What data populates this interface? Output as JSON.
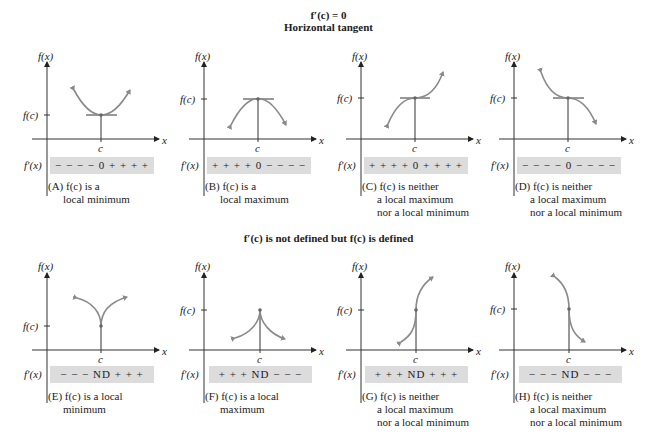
{
  "sections": [
    {
      "title_line1": "f′(c) = 0",
      "title_line2": "Horizontal tangent"
    },
    {
      "title_line1": "f′(c) is not defined but f(c) is defined"
    }
  ],
  "axis_labels": {
    "y": "f(x)",
    "x": "x",
    "fc": "f(c)",
    "c": "c",
    "fprime": "f′(x)"
  },
  "panels": [
    {
      "id": "A",
      "signs": "− − − − 0 + + + +",
      "caption_prefix": "(A)",
      "caption_lines": [
        "f(c) is a",
        "local minimum"
      ]
    },
    {
      "id": "B",
      "signs": "+ + + + 0 − − − −",
      "caption_prefix": "(B)",
      "caption_lines": [
        "f(c) is a",
        "local maximum"
      ]
    },
    {
      "id": "C",
      "signs": "+ + + + 0 + + + +",
      "caption_prefix": "(C)",
      "caption_lines": [
        "f(c) is neither",
        "a local maximum",
        "nor a local minimum"
      ]
    },
    {
      "id": "D",
      "signs": "− − − − 0 − − − −",
      "caption_prefix": "(D)",
      "caption_lines": [
        "f(c) is neither",
        "a local maximum",
        "nor a local minimum"
      ]
    },
    {
      "id": "E",
      "signs": "− − − ND + + +",
      "caption_prefix": "(E)",
      "caption_lines": [
        "f(c) is a local",
        "minimum"
      ]
    },
    {
      "id": "F",
      "signs": "+ + + ND − − −",
      "caption_prefix": "(F)",
      "caption_lines": [
        "f(c) is a local",
        "maximum"
      ]
    },
    {
      "id": "G",
      "signs": "+ + + ND + + +",
      "caption_prefix": "(G)",
      "caption_lines": [
        "f(c) is neither",
        "a local maximum",
        "nor a local minimum"
      ]
    },
    {
      "id": "H",
      "signs": "− − − ND − − −",
      "caption_prefix": "(H)",
      "caption_lines": [
        "f(c) is neither",
        "a local maximum",
        "nor a local minimum"
      ]
    }
  ],
  "colors": {
    "curve": "#8a8a8a",
    "axis": "#333333",
    "bar": "#dcdcdc"
  }
}
